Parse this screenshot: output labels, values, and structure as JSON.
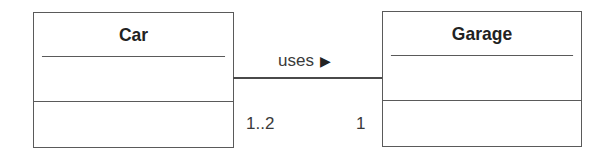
{
  "diagram": {
    "type": "UML class diagram",
    "classes": [
      {
        "name": "Car",
        "attributes": [],
        "operations": []
      },
      {
        "name": "Garage",
        "attributes": [],
        "operations": []
      }
    ],
    "association": {
      "label": "uses",
      "direction_icon": "right-triangle-icon",
      "direction_glyph": "▶",
      "source": "Car",
      "target": "Garage",
      "source_multiplicity": "1..2",
      "target_multiplicity": "1"
    }
  }
}
